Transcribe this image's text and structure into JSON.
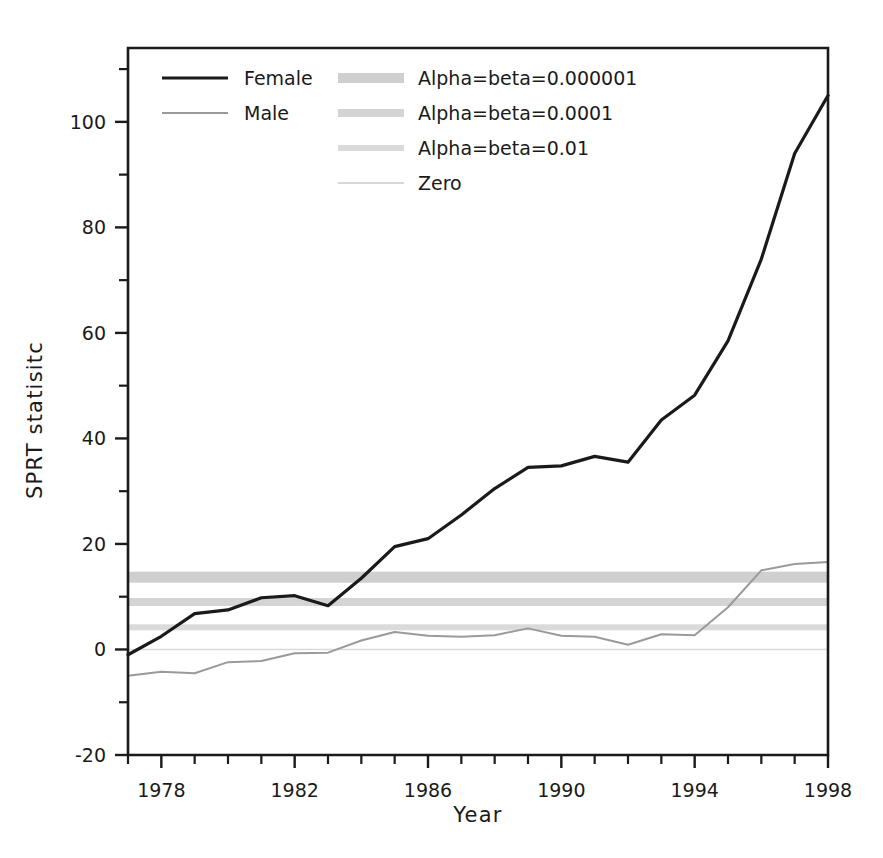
{
  "chart_data": {
    "type": "line",
    "title": "",
    "xlabel": "Year",
    "ylabel": "SPRT statisitc",
    "xlim": [
      1977,
      1998
    ],
    "ylim": [
      -20,
      114
    ],
    "grid": false,
    "legend_position": "top-left inside plot",
    "xticks": [
      1978,
      1982,
      1986,
      1990,
      1994,
      1998
    ],
    "xtick_labels": [
      "1978",
      "1982",
      "1986",
      "1990",
      "1994",
      "1998"
    ],
    "xminor_step": 1,
    "yticks": [
      -20,
      0,
      20,
      40,
      60,
      80,
      100
    ],
    "ytick_labels": [
      "-20",
      "0",
      "20",
      "40",
      "60",
      "80",
      "100"
    ],
    "yminor_step": 10,
    "x": [
      1977,
      1978,
      1979,
      1980,
      1981,
      1982,
      1983,
      1984,
      1985,
      1986,
      1987,
      1988,
      1989,
      1990,
      1991,
      1992,
      1993,
      1994,
      1995,
      1996,
      1997,
      1998
    ],
    "series": [
      {
        "name": "Female",
        "color": "#1a1a1a",
        "width": 3.2,
        "values": [
          -1.0,
          2.5,
          6.8,
          7.5,
          9.8,
          10.2,
          8.3,
          13.5,
          19.5,
          21.0,
          25.5,
          30.5,
          34.5,
          34.8,
          36.6,
          35.5,
          43.5,
          48.2,
          58.5,
          74.0,
          94.0,
          105.0
        ]
      },
      {
        "name": "Male",
        "color": "#9a9a9a",
        "width": 2.0,
        "values": [
          -5.0,
          -4.2,
          -4.5,
          -2.4,
          -2.2,
          -0.7,
          -0.6,
          1.7,
          3.3,
          2.6,
          2.4,
          2.7,
          4.0,
          2.6,
          2.4,
          0.9,
          2.9,
          2.7,
          8.0,
          15.0,
          16.2,
          16.6
        ]
      }
    ],
    "thresholds": [
      {
        "name": "Alpha=beta=0.000001",
        "value": 13.7,
        "color": "#cfcfcf",
        "thickness": 11
      },
      {
        "name": "Alpha=beta=0.0001",
        "value": 9.0,
        "color": "#d4d4d4",
        "thickness": 8
      },
      {
        "name": "Alpha=beta=0.01",
        "value": 4.2,
        "color": "#dadada",
        "thickness": 6
      },
      {
        "name": "Zero",
        "value": 0.0,
        "color": "#d8d8d8",
        "thickness": 1.4
      }
    ],
    "legend": [
      {
        "label": "Female",
        "swatch": "line",
        "color": "#1a1a1a",
        "thickness": 3.2
      },
      {
        "label": "Male",
        "swatch": "line",
        "color": "#9a9a9a",
        "thickness": 2.0
      },
      {
        "label": "Alpha=beta=0.000001",
        "swatch": "band",
        "color": "#cfcfcf",
        "thickness": 10
      },
      {
        "label": "Alpha=beta=0.0001",
        "swatch": "band",
        "color": "#d4d4d4",
        "thickness": 8
      },
      {
        "label": "Alpha=beta=0.01",
        "swatch": "band",
        "color": "#dadada",
        "thickness": 6
      },
      {
        "label": "Zero",
        "swatch": "band",
        "color": "#d8d8d8",
        "thickness": 2
      }
    ]
  }
}
